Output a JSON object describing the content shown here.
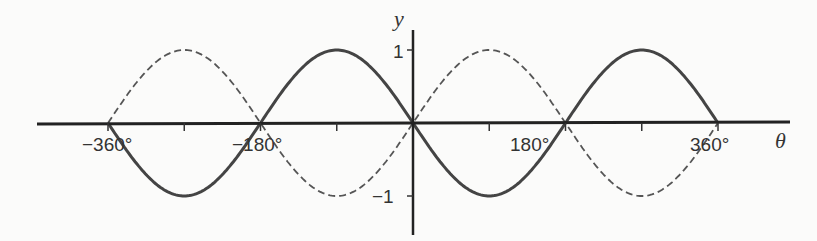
{
  "chart_data": {
    "type": "line",
    "title": "",
    "xlabel": "θ",
    "ylabel": "y",
    "xlim": [
      -360,
      360
    ],
    "ylim": [
      -1,
      1
    ],
    "grid": false,
    "legend": null,
    "x_ticks": [
      -360,
      -270,
      -180,
      -90,
      0,
      90,
      180,
      270,
      360
    ],
    "x_tick_labels": [
      "−360°",
      "−180°",
      "180°",
      "360°"
    ],
    "y_tick_labels": [
      "1",
      "−1"
    ],
    "x": [
      -360,
      -270,
      -180,
      -90,
      0,
      90,
      180,
      270,
      360
    ],
    "series": [
      {
        "name": "y = −sin θ",
        "style": "solid",
        "values": [
          0,
          -1,
          0,
          1,
          0,
          -1,
          0,
          1,
          0
        ]
      },
      {
        "name": "y = sin θ",
        "style": "dashed",
        "values": [
          0,
          1,
          0,
          -1,
          0,
          1,
          0,
          -1,
          0
        ]
      }
    ]
  },
  "labels": {
    "y_axis": "y",
    "x_axis": "θ",
    "y_pos": "1",
    "y_neg": "−1",
    "x_m360": "−360°",
    "x_m180": "−180°",
    "x_p180": "180°",
    "x_p360": "360°"
  }
}
